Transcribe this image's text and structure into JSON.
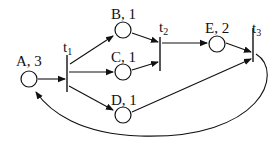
{
  "diagram": {
    "type": "petri-net",
    "places": [
      {
        "id": "A",
        "label": "A, 3",
        "tokens": 3
      },
      {
        "id": "B",
        "label": "B, 1",
        "tokens": 1
      },
      {
        "id": "C",
        "label": "C, 1",
        "tokens": 1
      },
      {
        "id": "D",
        "label": "D, 1",
        "tokens": 1
      },
      {
        "id": "E",
        "label": "E, 2",
        "tokens": 2
      }
    ],
    "transitions": [
      {
        "id": "t1",
        "base": "t",
        "sub": "1"
      },
      {
        "id": "t2",
        "base": "t",
        "sub": "2"
      },
      {
        "id": "t3",
        "base": "t",
        "sub": "3"
      }
    ],
    "arcs": [
      {
        "from": "A",
        "to": "t1"
      },
      {
        "from": "t1",
        "to": "B"
      },
      {
        "from": "t1",
        "to": "C"
      },
      {
        "from": "t1",
        "to": "D"
      },
      {
        "from": "B",
        "to": "t2"
      },
      {
        "from": "C",
        "to": "t2"
      },
      {
        "from": "t2",
        "to": "E"
      },
      {
        "from": "E",
        "to": "t3"
      },
      {
        "from": "D",
        "to": "t3"
      },
      {
        "from": "t3",
        "to": "A"
      }
    ]
  }
}
